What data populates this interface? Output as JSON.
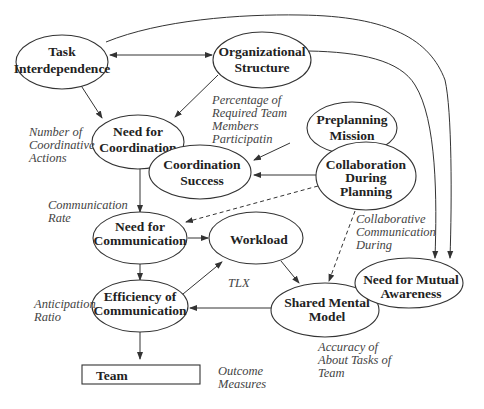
{
  "nodes": {
    "task_interdependence": {
      "lines": [
        "Task",
        "Interdependence"
      ]
    },
    "organizational_structure": {
      "lines": [
        "Organizational",
        "Structure"
      ]
    },
    "need_for_coordination": {
      "lines": [
        "Need for",
        "Coordination"
      ]
    },
    "preplanning_mission": {
      "lines": [
        "Preplanning",
        "Mission"
      ]
    },
    "coordination_success": {
      "lines": [
        "Coordination",
        "Success"
      ]
    },
    "collaboration_during_planning": {
      "lines": [
        "Collaboration",
        "During",
        "Planning"
      ]
    },
    "need_for_communication": {
      "lines": [
        "Need for",
        "Communication"
      ]
    },
    "workload": {
      "lines": [
        "Workload"
      ]
    },
    "efficiency_of_communication": {
      "lines": [
        "Efficiency of",
        "Communication"
      ]
    },
    "shared_mental_model": {
      "lines": [
        "Shared Mental",
        "Model"
      ]
    },
    "need_for_mutual_awareness": {
      "lines": [
        "Need for Mutual",
        "Awareness"
      ]
    },
    "team": {
      "lines": [
        "Team"
      ]
    }
  },
  "measures": {
    "number_of_coordinative_actions": {
      "lines": [
        "Number of",
        "Coordinative",
        "Actions"
      ]
    },
    "percentage_required_team_members": {
      "lines": [
        "Percentage of",
        "Required Team",
        "Members",
        "Participatin"
      ]
    },
    "communication_rate": {
      "lines": [
        "Communication",
        "Rate"
      ]
    },
    "collaborative_communication_during": {
      "lines": [
        "Collaborative",
        "Communication",
        "During"
      ]
    },
    "tlx": {
      "lines": [
        "TLX"
      ]
    },
    "anticipation_ratio": {
      "lines": [
        "Anticipation",
        "Ratio"
      ]
    },
    "accuracy_about_tasks": {
      "lines": [
        "Accuracy of",
        "About Tasks of",
        "Team"
      ]
    },
    "outcome_measures": {
      "lines": [
        "Outcome",
        "Measures"
      ]
    }
  },
  "edges": [
    {
      "from": "task_interdependence",
      "to": "organizational_structure",
      "style": "solid",
      "bidirectional": true
    },
    {
      "from": "task_interdependence",
      "to": "need_for_coordination",
      "style": "solid"
    },
    {
      "from": "organizational_structure",
      "to": "need_for_coordination",
      "style": "solid"
    },
    {
      "from": "preplanning_mission",
      "to": "coordination_success",
      "style": "solid"
    },
    {
      "from": "collaboration_during_planning",
      "to": "coordination_success",
      "style": "solid"
    },
    {
      "from": "need_for_coordination",
      "to": "need_for_communication",
      "style": "solid"
    },
    {
      "from": "collaboration_during_planning",
      "to": "need_for_communication",
      "style": "dashed"
    },
    {
      "from": "collaboration_during_planning",
      "to": "shared_mental_model",
      "style": "dashed"
    },
    {
      "from": "need_for_communication",
      "to": "workload",
      "style": "solid"
    },
    {
      "from": "need_for_communication",
      "to": "efficiency_of_communication",
      "style": "solid"
    },
    {
      "from": "efficiency_of_communication",
      "to": "workload",
      "style": "solid"
    },
    {
      "from": "workload",
      "to": "shared_mental_model",
      "style": "solid"
    },
    {
      "from": "need_for_mutual_awareness",
      "to": "efficiency_of_communication",
      "style": "solid",
      "via": "shared_mental_model"
    },
    {
      "from": "task_interdependence",
      "to": "need_for_mutual_awareness",
      "style": "solid"
    },
    {
      "from": "organizational_structure",
      "to": "need_for_mutual_awareness",
      "style": "solid"
    },
    {
      "from": "efficiency_of_communication",
      "to": "team",
      "style": "solid"
    }
  ]
}
